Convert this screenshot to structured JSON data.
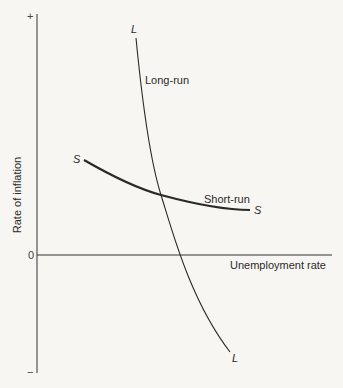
{
  "diagram": {
    "y_axis": {
      "label": "Rate of inflation",
      "top_marker": "+",
      "bottom_marker": "−",
      "zero_label": "0"
    },
    "x_axis": {
      "label": "Unemployment rate"
    },
    "curves": [
      {
        "name": "Long-run",
        "label": "Long-run",
        "end_label_top": "L",
        "end_label_bottom": "L",
        "style": "thin"
      },
      {
        "name": "Short-run",
        "label": "Short-run",
        "end_label_left": "S",
        "end_label_right": "S",
        "style": "thick"
      }
    ],
    "colors": {
      "background": "#f7f6f3",
      "ink": "#2a2a2a"
    }
  }
}
